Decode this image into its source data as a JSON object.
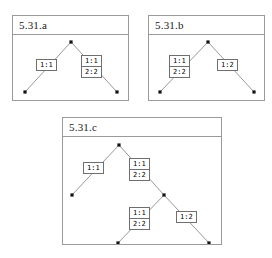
{
  "figure": {
    "background_color": "#ffffff",
    "border_color": "#9a9a9a",
    "edge_color": "#8d8d8d",
    "node_color": "#111111",
    "box_border_color": "#6f6f6f"
  },
  "panels": [
    {
      "id": "a",
      "title": "5.31.a",
      "frame": {
        "x": 12,
        "y": 15,
        "w": 117,
        "h": 86
      },
      "tree": {
        "nodes": [
          {
            "name": "root",
            "x": 58,
            "y": 7
          },
          {
            "name": "leaf-left",
            "x": 12,
            "y": 57
          },
          {
            "name": "leaf-right",
            "x": 104,
            "y": 57
          }
        ],
        "edges": [
          {
            "from": "root",
            "to": "leaf-left"
          },
          {
            "from": "root",
            "to": "leaf-right"
          }
        ],
        "labels": [
          {
            "name": "label-left",
            "x": 23,
            "y": 24,
            "rows": [
              "1:1"
            ]
          },
          {
            "name": "label-right",
            "x": 68,
            "y": 20,
            "rows": [
              "1:1",
              "2:2"
            ]
          }
        ]
      }
    },
    {
      "id": "b",
      "title": "5.31.b",
      "frame": {
        "x": 148,
        "y": 15,
        "w": 117,
        "h": 86
      },
      "tree": {
        "nodes": [
          {
            "name": "root",
            "x": 59,
            "y": 7
          },
          {
            "name": "leaf-left",
            "x": 11,
            "y": 57
          },
          {
            "name": "leaf-right",
            "x": 105,
            "y": 57
          }
        ],
        "edges": [
          {
            "from": "root",
            "to": "leaf-left"
          },
          {
            "from": "root",
            "to": "leaf-right"
          }
        ],
        "labels": [
          {
            "name": "label-left",
            "x": 20,
            "y": 20,
            "rows": [
              "1:1",
              "2:2"
            ]
          },
          {
            "name": "label-right",
            "x": 68,
            "y": 24,
            "rows": [
              "1:2"
            ]
          }
        ]
      }
    },
    {
      "id": "c",
      "title": "5.31.c",
      "frame": {
        "x": 62,
        "y": 117,
        "w": 160,
        "h": 128
      },
      "tree": {
        "nodes": [
          {
            "name": "root",
            "x": 56,
            "y": 8
          },
          {
            "name": "leaf-left",
            "x": 9,
            "y": 58
          },
          {
            "name": "internal-right",
            "x": 101,
            "y": 58
          },
          {
            "name": "leaf-mid",
            "x": 55,
            "y": 106
          },
          {
            "name": "leaf-far-right",
            "x": 146,
            "y": 106
          }
        ],
        "edges": [
          {
            "from": "root",
            "to": "leaf-left"
          },
          {
            "from": "root",
            "to": "internal-right"
          },
          {
            "from": "internal-right",
            "to": "leaf-mid"
          },
          {
            "from": "internal-right",
            "to": "leaf-far-right"
          }
        ],
        "labels": [
          {
            "name": "label-root-left",
            "x": 20,
            "y": 25,
            "rows": [
              "1:1"
            ]
          },
          {
            "name": "label-root-right",
            "x": 66,
            "y": 21,
            "rows": [
              "1:1",
              "2:2"
            ]
          },
          {
            "name": "label-internal-left",
            "x": 66,
            "y": 70,
            "rows": [
              "1:1",
              "2:2"
            ]
          },
          {
            "name": "label-internal-right",
            "x": 113,
            "y": 74,
            "rows": [
              "1:2"
            ]
          }
        ]
      }
    }
  ]
}
